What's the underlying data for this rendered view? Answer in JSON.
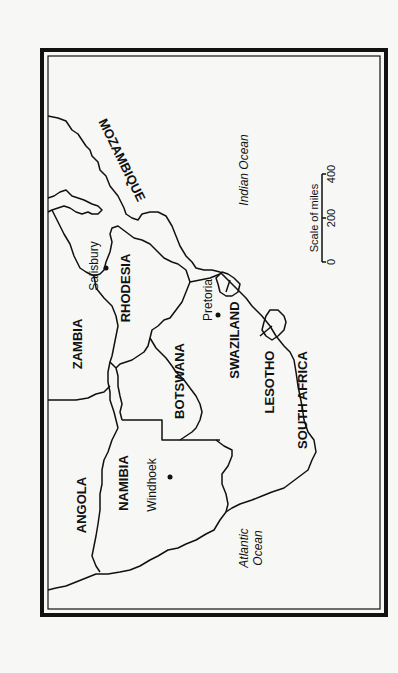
{
  "map": {
    "orientation": "rotated-90-ccw",
    "colors": {
      "ink": "#111111",
      "paper": "#f7f7f5"
    },
    "countries": [
      {
        "id": "angola",
        "label": "ANGOLA"
      },
      {
        "id": "zambia",
        "label": "ZAMBIA"
      },
      {
        "id": "namibia",
        "label": "NAMIBIA"
      },
      {
        "id": "botswana",
        "label": "BOTSWANA"
      },
      {
        "id": "rhodesia",
        "label": "RHODESIA"
      },
      {
        "id": "mozambique",
        "label": "MOZAMBIQUE"
      },
      {
        "id": "swaziland",
        "label": "SWAZILAND"
      },
      {
        "id": "lesotho",
        "label": "LESOTHO"
      },
      {
        "id": "south-africa",
        "label": "SOUTH AFRICA"
      }
    ],
    "cities": [
      {
        "id": "windhoek",
        "label": "Windhoek"
      },
      {
        "id": "salisbury",
        "label": "Salisbury"
      },
      {
        "id": "pretoria",
        "label": "Pretoria"
      }
    ],
    "oceans": [
      {
        "id": "indian",
        "label": "Indian Ocean"
      },
      {
        "id": "atlantic-line1",
        "label": "Atlantic"
      },
      {
        "id": "atlantic-line2",
        "label": "Ocean"
      }
    ],
    "scale": {
      "title": "Scale of miles",
      "ticks": [
        "0",
        "200",
        "400"
      ]
    }
  }
}
